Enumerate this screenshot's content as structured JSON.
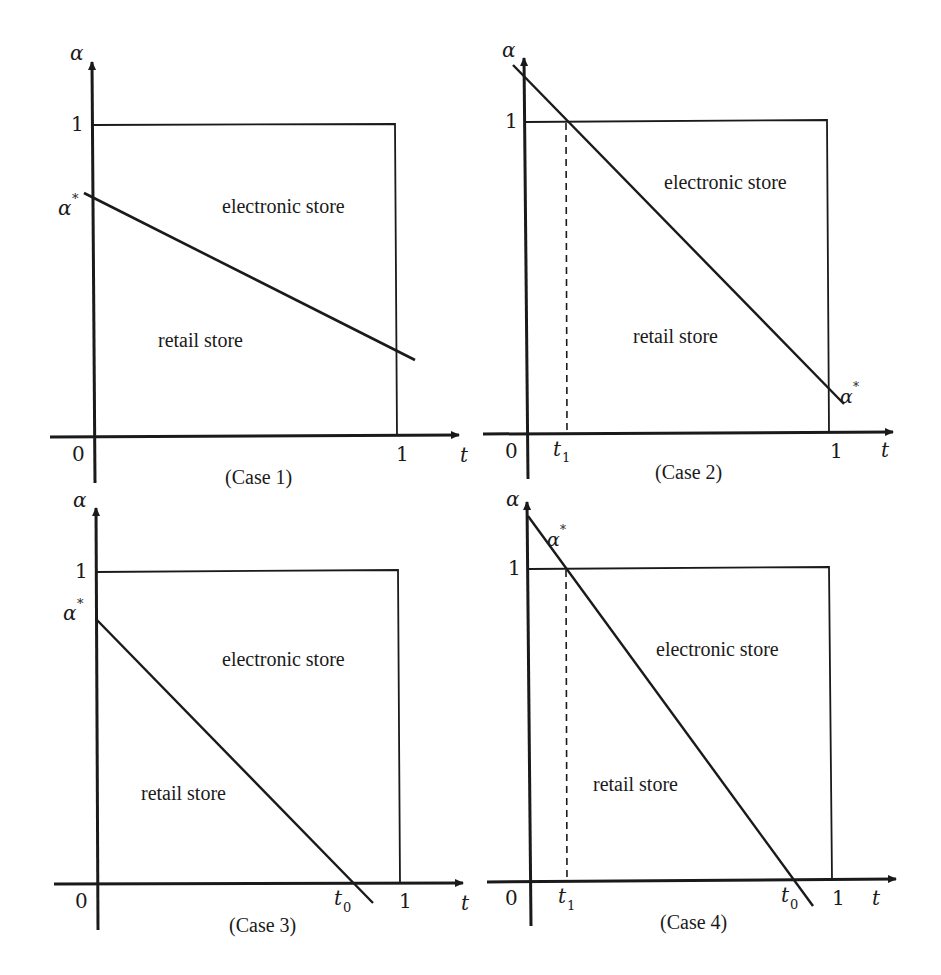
{
  "figure": {
    "panels": [
      {
        "id": "case1",
        "caption": "(Case 1)",
        "y_axis_label": "α",
        "x_axis_label": "t",
        "y_tick_one": "1",
        "x_tick_zero": "0",
        "x_tick_one": "1",
        "alpha_star_label": "α*",
        "region_upper": "electronic store",
        "region_lower": "retail store",
        "extra_ticks": []
      },
      {
        "id": "case2",
        "caption": "(Case 2)",
        "y_axis_label": "α",
        "x_axis_label": "t",
        "y_tick_one": "1",
        "x_tick_zero": "0",
        "x_tick_one": "1",
        "alpha_star_label": "α*",
        "region_upper": "electronic store",
        "region_lower": "retail store",
        "extra_ticks": [
          "t1"
        ],
        "t1_label": "t",
        "t1_sub": "1"
      },
      {
        "id": "case3",
        "caption": "(Case 3)",
        "y_axis_label": "α",
        "x_axis_label": "t",
        "y_tick_one": "1",
        "x_tick_zero": "0",
        "x_tick_one": "1",
        "alpha_star_label": "α*",
        "region_upper": "electronic store",
        "region_lower": "retail store",
        "extra_ticks": [
          "t0"
        ],
        "t0_label": "t",
        "t0_sub": "0"
      },
      {
        "id": "case4",
        "caption": "(Case 4)",
        "y_axis_label": "α",
        "x_axis_label": "t",
        "y_tick_one": "1",
        "x_tick_zero": "0",
        "x_tick_one": "1",
        "alpha_star_label": "α*",
        "region_upper": "electronic store",
        "region_lower": "retail store",
        "extra_ticks": [
          "t1",
          "t0"
        ],
        "t1_label": "t",
        "t1_sub": "1",
        "t0_label": "t",
        "t0_sub": "0"
      }
    ],
    "colors": {
      "ink": "#1a1a1a",
      "background": "#ffffff"
    }
  }
}
